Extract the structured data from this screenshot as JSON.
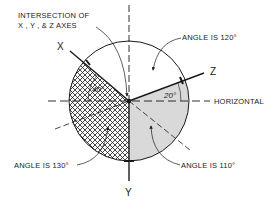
{
  "diagram": {
    "title_callout": {
      "line1": "INTERSECTION OF",
      "line2": "X , Y , & Z  AXES"
    },
    "axes": {
      "x_label": "X",
      "y_label": "Y",
      "z_label": "Z"
    },
    "reference_line_label": "HORIZONTAL",
    "angle_labels": {
      "x_above_horizontal": "40°",
      "z_above_horizontal": "20°"
    },
    "callouts": {
      "angle_xz": "ANGLE IS 120°",
      "angle_xy": "ANGLE IS 130°",
      "angle_yz": "ANGLE IS 110°"
    },
    "colors": {
      "ink": "#1a1a1a",
      "stipple": "#c8c8c8",
      "background": "#ffffff"
    }
  }
}
